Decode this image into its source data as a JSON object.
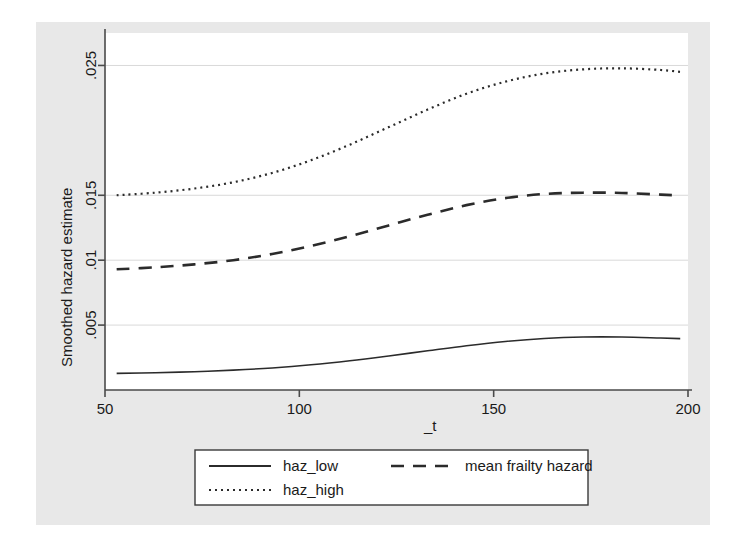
{
  "chart_data": {
    "type": "line",
    "title": "",
    "xlabel": "_t",
    "ylabel": "Smoothed hazard estimate",
    "xlim": [
      50,
      200
    ],
    "ylim": [
      0,
      0.0275
    ],
    "xticks": [
      50,
      100,
      150,
      200
    ],
    "xticklabels": [
      "50",
      "100",
      "150",
      "200"
    ],
    "yticks": [
      0.005,
      0.01,
      0.015,
      0.025
    ],
    "yticklabels": [
      ".005",
      ".01",
      ".015",
      ".025"
    ],
    "grid": true,
    "grid_axis": "y",
    "legend_position": "below",
    "background": "#e8e8e8",
    "plot_background": "#ffffff",
    "line_color": "#2b2b2b",
    "grid_color": "#d9d9d9",
    "series": [
      {
        "name": "haz_low",
        "style": "solid",
        "x": [
          53,
          63,
          73,
          83,
          93,
          103,
          113,
          123,
          133,
          143,
          153,
          163,
          173,
          183,
          193,
          198
        ],
        "values": [
          0.00128,
          0.00133,
          0.00141,
          0.00153,
          0.0017,
          0.00194,
          0.00225,
          0.00262,
          0.00302,
          0.00341,
          0.00374,
          0.00397,
          0.00408,
          0.00408,
          0.004,
          0.00396
        ]
      },
      {
        "name": "mean frailty hazard",
        "style": "dashed",
        "x": [
          53,
          63,
          73,
          83,
          93,
          103,
          113,
          123,
          133,
          143,
          153,
          163,
          173,
          183,
          193,
          198
        ],
        "values": [
          0.0093,
          0.00945,
          0.00968,
          0.01,
          0.01048,
          0.0111,
          0.01185,
          0.01268,
          0.0135,
          0.01424,
          0.01478,
          0.0151,
          0.0152,
          0.01518,
          0.01505,
          0.01498
        ]
      },
      {
        "name": "haz_high",
        "style": "dotted",
        "x": [
          53,
          63,
          73,
          83,
          93,
          103,
          113,
          123,
          133,
          143,
          153,
          163,
          173,
          183,
          193,
          198
        ],
        "values": [
          0.015,
          0.0152,
          0.01552,
          0.016,
          0.01672,
          0.0177,
          0.0189,
          0.02025,
          0.0216,
          0.02282,
          0.02375,
          0.02438,
          0.0247,
          0.02478,
          0.02465,
          0.0245
        ]
      }
    ]
  },
  "legend": {
    "entries": [
      {
        "label": "haz_low",
        "style": "solid"
      },
      {
        "label": "mean frailty hazard",
        "style": "dashed"
      },
      {
        "label": "haz_high",
        "style": "dotted"
      }
    ]
  }
}
